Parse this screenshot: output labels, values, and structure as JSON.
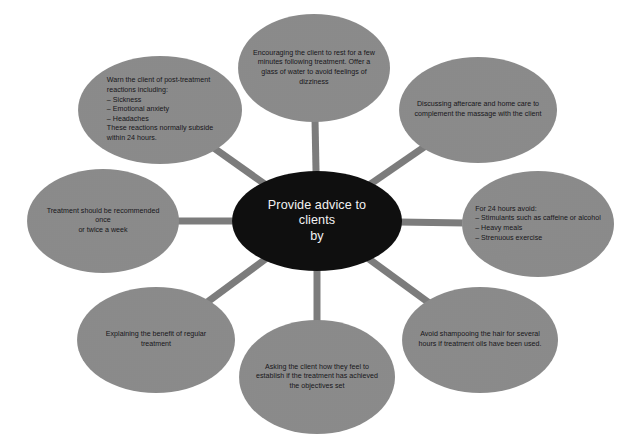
{
  "diagram": {
    "type": "hub-and-spoke-mind-map",
    "background_color": "#ffffff",
    "center": {
      "label": "Provide advice to clients\nby",
      "fill_color": "#0f0f0f",
      "text_color": "#f2f2f2",
      "cx": 317,
      "cy": 221,
      "rx": 85,
      "ry": 50
    },
    "connector": {
      "color": "#7c7c7c",
      "width": 7
    },
    "satellites": [
      {
        "id": "post-treatment-reactions",
        "label": "Warn the client of post-treatment\nreactions including:\n– Sickness\n– Emotional anxiety\n– Headaches\nThese reactions normally subside\nwithin 24 hours.",
        "align": "left",
        "fill_color": "#8d8d8d",
        "text_color": "#17161a",
        "cx": 160,
        "cy": 110,
        "rx": 82,
        "ry": 54
      },
      {
        "id": "rest-and-water",
        "label": "Encouraging the client to rest for a few\nminutes following treatment. Offer a\nglass of water to avoid feelings of\ndizziness",
        "align": "center",
        "fill_color": "#8d8d8d",
        "text_color": "#17161a",
        "cx": 314,
        "cy": 68,
        "rx": 76,
        "ry": 54
      },
      {
        "id": "aftercare-home-care",
        "label": "Discussing aftercare and home care to\ncomplement the massage with the client",
        "align": "center",
        "fill_color": "#8d8d8d",
        "text_color": "#17161a",
        "cx": 478,
        "cy": 110,
        "rx": 79,
        "ry": 53
      },
      {
        "id": "for-24-hours-avoid",
        "label": "For 24 hours avoid:\n– Stimulants such as caffeine or alcohol\n– Heavy meals\n– Strenuous exercise",
        "align": "left",
        "fill_color": "#8d8d8d",
        "text_color": "#17161a",
        "cx": 538,
        "cy": 224,
        "rx": 76,
        "ry": 53
      },
      {
        "id": "avoid-shampooing",
        "label": "Avoid shampooing the hair for several\nhours if treatment oils have been used.",
        "align": "center",
        "fill_color": "#8d8d8d",
        "text_color": "#17161a",
        "cx": 480,
        "cy": 340,
        "rx": 78,
        "ry": 53
      },
      {
        "id": "asking-how-they-feel",
        "label": "Asking the client how they feel to\nestablish if the treatment has achieved\nthe objectives set",
        "align": "center",
        "fill_color": "#8d8d8d",
        "text_color": "#17161a",
        "cx": 317,
        "cy": 377,
        "rx": 78,
        "ry": 57
      },
      {
        "id": "benefit-of-regular-treatment",
        "label": "Explaining the benefit of regular\ntreatment",
        "align": "center",
        "fill_color": "#8d8d8d",
        "text_color": "#17161a",
        "cx": 156,
        "cy": 340,
        "rx": 79,
        "ry": 53
      },
      {
        "id": "recommended-frequency",
        "label": "Treatment should be recommended once\nor twice a week",
        "align": "center",
        "fill_color": "#8d8d8d",
        "text_color": "#17161a",
        "cx": 103,
        "cy": 221,
        "rx": 76,
        "ry": 52
      }
    ]
  }
}
